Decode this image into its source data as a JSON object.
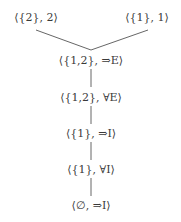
{
  "diagram": {
    "type": "proof-tree",
    "nodes": [
      {
        "id": "n1",
        "label": "⟨{2}, 2⟩",
        "x": 36,
        "y": 18
      },
      {
        "id": "n2",
        "label": "⟨{1}, 1⟩",
        "x": 147,
        "y": 18
      },
      {
        "id": "n3",
        "label": "⟨{1,2}, ⇒E⟩",
        "x": 91,
        "y": 61
      },
      {
        "id": "n4",
        "label": "⟨{1,2}, ∀E⟩",
        "x": 91,
        "y": 98
      },
      {
        "id": "n5",
        "label": "⟨{1}, ⇒I⟩",
        "x": 91,
        "y": 134
      },
      {
        "id": "n6",
        "label": "⟨{1}, ∀I⟩",
        "x": 91,
        "y": 170
      },
      {
        "id": "n7",
        "label": "⟨∅, ⇒I⟩",
        "x": 91,
        "y": 206
      }
    ],
    "edges": [
      {
        "from": "n1",
        "to": "n3"
      },
      {
        "from": "n2",
        "to": "n3"
      },
      {
        "from": "n3",
        "to": "n4"
      },
      {
        "from": "n4",
        "to": "n5"
      },
      {
        "from": "n5",
        "to": "n6"
      },
      {
        "from": "n6",
        "to": "n7"
      }
    ],
    "line_color": "#555555"
  }
}
